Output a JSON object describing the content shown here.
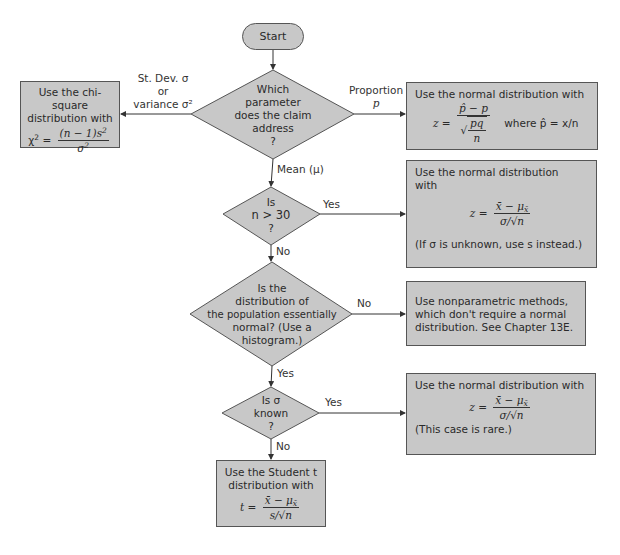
{
  "start": {
    "label": "Start"
  },
  "decisions": [
    {
      "id": "parameter",
      "lines": [
        "Which",
        "parameter",
        "does the claim",
        "address",
        "?"
      ]
    },
    {
      "id": "n-gt-30",
      "lines": [
        "Is",
        "n > 30",
        "?"
      ]
    },
    {
      "id": "normal-population",
      "lines": [
        "Is the",
        "distribution of",
        "the population essentially",
        "normal? (Use a",
        "histogram.)"
      ]
    },
    {
      "id": "sigma-known",
      "lines": [
        "Is σ",
        "known",
        "?"
      ]
    }
  ],
  "branch_labels": {
    "stdev_line1": "St. Dev. σ",
    "stdev_line2": "or",
    "stdev_line3": "variance σ²",
    "proportion_line1": "Proportion",
    "proportion_line2": "p",
    "mean": "Mean (μ)",
    "yes_n30": "Yes",
    "no_n30": "No",
    "no_normal": "No",
    "yes_normal": "Yes",
    "yes_sigma": "Yes",
    "no_sigma": "No"
  },
  "outcomes": {
    "chi_square": {
      "line1": "Use the chi-square",
      "line2": "distribution with",
      "lhs": "χ",
      "lhs_sup": "2",
      "eq": " = ",
      "num": "(n − 1)s",
      "num_sup": "2",
      "den": "σ",
      "den_sup": "2"
    },
    "proportion": {
      "line1": "Use the normal distribution with",
      "lhs": "z = ",
      "num": "p̂ − p",
      "den_sqrt_num": "pq",
      "den_sqrt_den": "n",
      "where": "where p̂ = x/n"
    },
    "large_n": {
      "line1": "Use the normal distribution",
      "line2": "with",
      "lhs": "z = ",
      "num": "x̄ − μ",
      "num_sub": "x̄",
      "den": "σ/√n",
      "note": "(If σ is unknown, use s instead.)"
    },
    "nonparametric": {
      "line1": "Use nonparametric methods,",
      "line2": "which don't require a normal",
      "line3": "distribution. See Chapter 13E."
    },
    "sigma_known": {
      "line1": "Use the normal distribution with",
      "lhs": "z = ",
      "num": "x̄ − μ",
      "num_sub": "x̄",
      "den": "σ/√n",
      "note": "(This case is rare.)"
    },
    "student_t": {
      "line1": "Use the Student t",
      "line2": "distribution with",
      "lhs": "t = ",
      "num": "x̄ − μ",
      "num_sub": "x̄",
      "den": "s/√n"
    }
  },
  "colors": {
    "fill": "#c8c8c8",
    "stroke": "#555555",
    "text": "#2a2a2a"
  }
}
